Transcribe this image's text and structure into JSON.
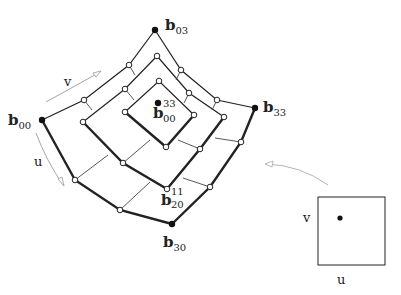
{
  "labels": {
    "b03": {
      "base": "b",
      "sub": "03",
      "sup": ""
    },
    "b00": {
      "base": "b",
      "sub": "00",
      "sup": ""
    },
    "b33": {
      "base": "b",
      "sub": "33",
      "sup": ""
    },
    "b30": {
      "base": "b",
      "sub": "30",
      "sup": ""
    },
    "b00_33": {
      "base": "b",
      "sub": "00",
      "sup": "33"
    },
    "b20_11": {
      "base": "b",
      "sub": "20",
      "sup": "11"
    }
  },
  "axes": {
    "v_arrow_label": "v",
    "u_arrow_label": "u",
    "domain_v_label": "v",
    "domain_u_label": "u"
  },
  "colors": {
    "ink": "#222222",
    "thin_line": "#444444",
    "arrow": "#999999",
    "background": "#ffffff"
  }
}
